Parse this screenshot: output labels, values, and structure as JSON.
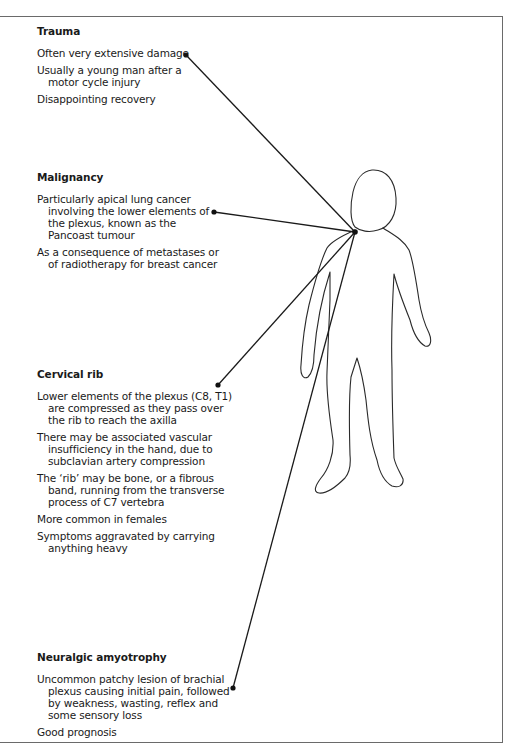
{
  "diagram": {
    "type": "annotated-figure",
    "hub_point": {
      "x": 355,
      "y": 232,
      "label": "brachial plexus"
    },
    "line_color": "#1a1a1a",
    "frame_color": "#6a6a6a"
  },
  "sections": [
    {
      "id": "trauma",
      "title": "Trauma",
      "items": [
        "Often very extensive damage",
        "Usually a young man after a motor cycle injury",
        "Disappointing recovery"
      ],
      "pointer": {
        "x": 186,
        "y": 55
      }
    },
    {
      "id": "malignancy",
      "title": "Malignancy",
      "items": [
        "Particularly apical lung cancer involving the lower elements of the plexus, known as the Pancoast tumour",
        "As a consequence of metastases or of radiotherapy for breast cancer"
      ],
      "pointer": {
        "x": 214,
        "y": 212
      }
    },
    {
      "id": "cervical-rib",
      "title": "Cervical rib",
      "items": [
        "Lower elements of the plexus (C8, T1) are compressed as they pass over the rib to reach the axilla",
        "There may be associated vascular insufficiency in the hand, due to subclavian artery compression",
        "The ‘rib’ may be bone, or a fibrous band, running from the transverse process of C7 vertebra",
        "More common in females",
        "Symptoms aggravated by carrying anything heavy"
      ],
      "pointer": {
        "x": 218,
        "y": 385
      }
    },
    {
      "id": "neuralgic-amyotrophy",
      "title": "Neuralgic amyotrophy",
      "items": [
        "Uncommon patchy lesion of brachial plexus causing initial pain, followed by weakness, wasting, reflex and some sensory loss",
        "Good prognosis"
      ],
      "pointer": {
        "x": 233,
        "y": 688
      }
    }
  ]
}
